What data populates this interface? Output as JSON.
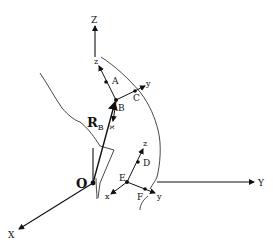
{
  "diagram": {
    "global_frame": {
      "origin_label": "O",
      "axes": {
        "x_label": "X",
        "y_label": "Y",
        "z_label": "Z"
      }
    },
    "position_vector": {
      "label": "R",
      "subscript": "B"
    },
    "local_frame_B": {
      "origin_label": "B",
      "x_label": "x",
      "y_label": "y",
      "z_label": "z",
      "points": [
        "A",
        "C"
      ]
    },
    "local_frame_E": {
      "origin_label": "E",
      "x_label": "x",
      "y_label": "y",
      "z_label": "z",
      "points": [
        "D",
        "F"
      ]
    },
    "colors": {
      "line": "#111111",
      "surface": "#333333",
      "background": "#ffffff"
    }
  }
}
